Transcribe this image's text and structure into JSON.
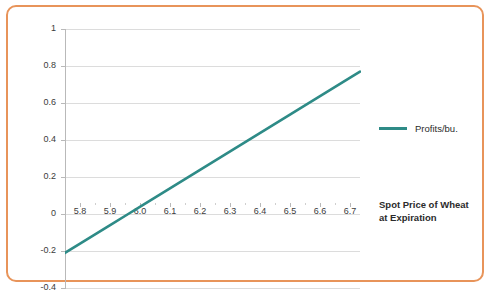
{
  "frame": {
    "border_color": "#e8945a"
  },
  "legend": {
    "position": "right",
    "entries": [
      {
        "label": "Profits/bu.",
        "color": "#2e8b87"
      }
    ]
  },
  "axis_title": {
    "line1": "Spot Price of Wheat",
    "line2": "at Expiration"
  },
  "chart_data": {
    "type": "line",
    "title": "",
    "subtitle": "",
    "xlabel": "Spot Price of Wheat at Expiration",
    "ylabel": "",
    "xlim": [
      5.75,
      6.73
    ],
    "ylim": [
      -0.4,
      1.0
    ],
    "grid": true,
    "grid_axis": "y",
    "legend_position": "right",
    "xticks": [
      "5.8",
      "5.9",
      "6.0",
      "6.1",
      "6.2",
      "6.3",
      "6.4",
      "6.5",
      "6.6",
      "6.7"
    ],
    "xtick_values": [
      5.8,
      5.9,
      6.0,
      6.1,
      6.2,
      6.3,
      6.4,
      6.5,
      6.6,
      6.7
    ],
    "yticks": [
      "1",
      "0.8",
      "0.6",
      "0.4",
      "0.2",
      "0",
      "-0.2",
      "-0.4"
    ],
    "ytick_values": [
      1,
      0.8,
      0.6,
      0.4,
      0.2,
      0,
      -0.2,
      -0.4
    ],
    "series": [
      {
        "name": "Profits/bu.",
        "color": "#2e8b87",
        "x": [
          5.75,
          5.8,
          5.9,
          5.96,
          6.0,
          6.1,
          6.2,
          6.3,
          6.4,
          6.5,
          6.6,
          6.7,
          6.73
        ],
        "values": [
          -0.21,
          -0.16,
          -0.06,
          0.0,
          0.04,
          0.14,
          0.24,
          0.34,
          0.44,
          0.54,
          0.64,
          0.74,
          0.77
        ]
      }
    ]
  }
}
